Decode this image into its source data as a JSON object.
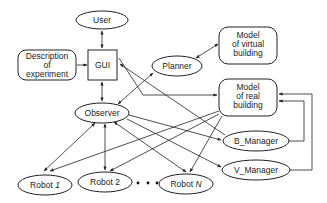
{
  "diagram": {
    "nodes": {
      "user": {
        "label": "User",
        "shape": "ellipse"
      },
      "description": {
        "lines": [
          "Description",
          "of",
          "experiment"
        ],
        "shape": "rounded-rect"
      },
      "gui": {
        "label": "GUI",
        "shape": "rect"
      },
      "planner": {
        "label": "Planner",
        "shape": "ellipse"
      },
      "model_virtual": {
        "lines": [
          "Model",
          "of virtual",
          "building"
        ],
        "shape": "rounded-rect"
      },
      "model_real": {
        "lines": [
          "Model",
          "of real",
          "building"
        ],
        "shape": "rounded-rect"
      },
      "observer": {
        "label": "Observer",
        "shape": "ellipse"
      },
      "b_manager": {
        "label": "B_Manager",
        "shape": "ellipse"
      },
      "v_manager": {
        "label": "V_Manager",
        "shape": "ellipse"
      },
      "robot1": {
        "label_prefix": "Robot ",
        "label_suffix": "1",
        "shape": "ellipse"
      },
      "robot2": {
        "label": "Robot 2",
        "shape": "ellipse"
      },
      "robotN": {
        "label_prefix": "Robot ",
        "label_suffix": "N",
        "shape": "ellipse"
      }
    },
    "ellipsis": "• • •",
    "edges": [
      {
        "from": "user",
        "to": "gui",
        "direction": "both"
      },
      {
        "from": "description",
        "to": "gui",
        "direction": "forward"
      },
      {
        "from": "gui",
        "to": "observer",
        "direction": "both"
      },
      {
        "from": "planner",
        "to": "model_virtual",
        "direction": "both"
      },
      {
        "from": "planner",
        "to": "observer",
        "direction": "both"
      },
      {
        "from": "gui",
        "to": "model_real",
        "direction": "forward"
      },
      {
        "from": "b_manager",
        "to": "gui",
        "direction": "forward"
      },
      {
        "from": "observer",
        "to": "b_manager",
        "direction": "forward"
      },
      {
        "from": "observer",
        "to": "v_manager",
        "direction": "forward"
      },
      {
        "from": "observer",
        "to": "robot1",
        "direction": "both"
      },
      {
        "from": "observer",
        "to": "robot2",
        "direction": "both"
      },
      {
        "from": "observer",
        "to": "robotN",
        "direction": "both"
      },
      {
        "from": "model_real",
        "to": "robot1",
        "direction": "forward"
      },
      {
        "from": "model_real",
        "to": "robot2",
        "direction": "forward"
      },
      {
        "from": "model_real",
        "to": "robotN",
        "direction": "forward"
      },
      {
        "from": "b_manager",
        "to": "model_real",
        "direction": "forward"
      },
      {
        "from": "v_manager",
        "to": "model_real",
        "direction": "forward"
      }
    ]
  }
}
